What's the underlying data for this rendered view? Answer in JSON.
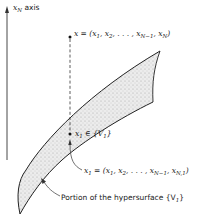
{
  "diagram": {
    "axis": {
      "label_var": "x",
      "label_sub": "N",
      "label_text": " axis"
    },
    "point_x": {
      "label": "x = (x₁, x₂, . . . , x_{N−1}, x_N)",
      "lhs": "x = (",
      "parts": [
        "x",
        "1",
        ", x",
        "2",
        ", . . . , x",
        "N−1",
        ", x",
        "N",
        ")"
      ]
    },
    "point_x1_member": {
      "lhs": "x",
      "lhs_sub": "1",
      "rel": " ∈ {V",
      "set_sub": "1",
      "close": "}"
    },
    "point_x1_def": {
      "lhs": "x",
      "lhs_sub": "1",
      "eq": " = (x",
      "p1": "1",
      "mid1": ", x",
      "p2": "2",
      "mid2": ", . . . , x",
      "p3": "N−1",
      "mid3": ", x",
      "p4": "N,1",
      "close": ")"
    },
    "surface": {
      "caption": "Portion of the hypersurface {V",
      "caption_sub": "1",
      "caption_close": "}"
    },
    "colors": {
      "ink": "#1a1a1a",
      "fill": "#d9d9d9"
    }
  }
}
